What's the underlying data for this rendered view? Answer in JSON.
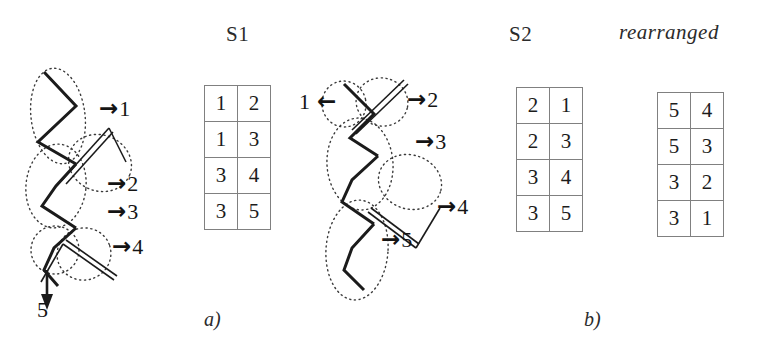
{
  "figure": {
    "panels": [
      {
        "id": "a",
        "label": "a)"
      },
      {
        "id": "b",
        "label": "b)"
      }
    ]
  },
  "diagram_left": {
    "name": "knot-diagram-s1",
    "strand_markers": [
      {
        "arrow": "→",
        "number": "1"
      },
      {
        "arrow": "→",
        "number": "2"
      },
      {
        "arrow": "→",
        "number": "3"
      },
      {
        "arrow": "→",
        "number": "4"
      }
    ],
    "bottom_marker": {
      "arrow": "↓",
      "number": "5"
    }
  },
  "diagram_right": {
    "name": "knot-diagram-s2",
    "left_marker": {
      "number": "1",
      "arrow": "←"
    },
    "strand_markers": [
      {
        "arrow": "→",
        "number": "2"
      },
      {
        "arrow": "→",
        "number": "3"
      },
      {
        "arrow": "→",
        "number": "4"
      },
      {
        "arrow": "→",
        "number": "5"
      }
    ]
  },
  "tables": {
    "s1": {
      "title": "S1",
      "rows": [
        [
          "1",
          "2"
        ],
        [
          "1",
          "3"
        ],
        [
          "3",
          "4"
        ],
        [
          "3",
          "5"
        ]
      ]
    },
    "s2": {
      "title": "S2",
      "rows": [
        [
          "2",
          "1"
        ],
        [
          "2",
          "3"
        ],
        [
          "3",
          "4"
        ],
        [
          "3",
          "5"
        ]
      ]
    },
    "rearranged": {
      "title": "rearranged",
      "rows": [
        [
          "5",
          "4"
        ],
        [
          "5",
          "3"
        ],
        [
          "3",
          "2"
        ],
        [
          "3",
          "1"
        ]
      ]
    }
  },
  "colors": {
    "ink": "#1a1a1a",
    "rule": "#808080",
    "background": "#ffffff"
  }
}
